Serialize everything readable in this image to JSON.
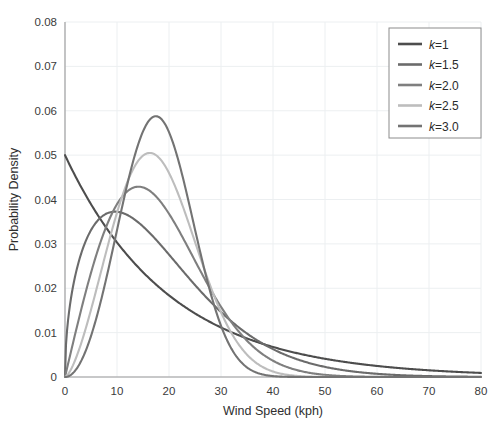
{
  "chart_data": {
    "type": "line",
    "title": "",
    "xlabel": "Wind Speed (kph)",
    "ylabel": "Probability Density",
    "xlim": [
      0,
      80
    ],
    "ylim": [
      0,
      0.08
    ],
    "xticks": [
      0,
      10,
      20,
      30,
      40,
      50,
      60,
      70,
      80
    ],
    "xtick_labels": [
      "0",
      "10",
      "20",
      "30",
      "40",
      "50",
      "60",
      "70",
      "80"
    ],
    "yticks": [
      0,
      0.01,
      0.02,
      0.03,
      0.04,
      0.05,
      0.06,
      0.07,
      0.08
    ],
    "ytick_labels": [
      "0",
      "0.01",
      "0.02",
      "0.03",
      "0.04",
      "0.05",
      "0.06",
      "0.07",
      "0.08"
    ],
    "grid": true,
    "legend_position": "upper right",
    "distribution": "Weibull",
    "scale_lambda": 20,
    "series": [
      {
        "name": "k=1",
        "label_prefix": "k",
        "label_suffix": "=1",
        "shape_k": 1.0,
        "color": "#4d4d4d",
        "peak_x": 0,
        "peak_y": 0.05,
        "x": [
          0,
          2,
          4,
          6,
          8,
          10,
          12,
          14,
          16,
          18,
          20,
          25,
          30,
          35,
          40,
          45,
          50,
          55,
          60,
          65,
          70,
          75,
          80
        ],
        "y": [
          0.05,
          0.04524,
          0.04094,
          0.03704,
          0.03352,
          0.03033,
          0.02744,
          0.02483,
          0.02247,
          0.02033,
          0.01839,
          0.01433,
          0.01116,
          0.00869,
          0.00677,
          0.00527,
          0.0041,
          0.00319,
          0.00249,
          0.00194,
          0.00151,
          0.00118,
          0.00092
        ]
      },
      {
        "name": "k=1.5",
        "label_prefix": "k",
        "label_suffix": "=1.5",
        "shape_k": 1.5,
        "color": "#6b6b6b",
        "peak_x": 9.2,
        "peak_y": 0.03655,
        "x": [
          0,
          2,
          4,
          6,
          8,
          10,
          12,
          14,
          16,
          18,
          20,
          25,
          30,
          35,
          40,
          45,
          50,
          55,
          60,
          65,
          70,
          75,
          80
        ],
        "y": [
          0,
          0.02241,
          0.02994,
          0.03379,
          0.03566,
          0.03632,
          0.03618,
          0.03551,
          0.03447,
          0.03318,
          0.03172,
          0.02762,
          0.02333,
          0.01922,
          0.01548,
          0.01222,
          0.00947,
          0.00722,
          0.0054,
          0.00398,
          0.00288,
          0.00206,
          0.00145
        ]
      },
      {
        "name": "k=2.0",
        "label_prefix": "k",
        "label_suffix": "=2.0",
        "shape_k": 2.0,
        "color": "#7f7f7f",
        "peak_x": 14.1,
        "peak_y": 0.04289,
        "x": [
          0,
          2,
          4,
          6,
          8,
          10,
          12,
          14,
          16,
          18,
          20,
          25,
          30,
          35,
          40,
          45,
          50,
          55,
          60,
          65,
          70,
          75,
          80
        ],
        "y": [
          0,
          0.00995,
          0.01961,
          0.02866,
          0.03679,
          0.04382,
          0.04959,
          0.04289,
          0.04277,
          0.04148,
          0.03679,
          0.0255,
          0.01582,
          0.00876,
          0.00432,
          0.0019,
          0.00075,
          0.00026,
          8e-05,
          2e-05,
          1e-05,
          0.0,
          0.0
        ]
      },
      {
        "name": "k=2.5",
        "label_prefix": "k",
        "label_suffix": "=2.5",
        "shape_k": 2.5,
        "color": "#bdbdbd",
        "peak_x": 15.9,
        "peak_y": 0.05017,
        "x": [
          0,
          2,
          4,
          6,
          8,
          10,
          12,
          14,
          16,
          18,
          20,
          25,
          30,
          35,
          40,
          45,
          50,
          55,
          60,
          65,
          70,
          75,
          80
        ],
        "y": [
          0,
          0.00395,
          0.01105,
          0.01975,
          0.02915,
          0.03817,
          0.04545,
          0.04944,
          0.05017,
          0.04617,
          0.03991,
          0.02104,
          0.00785,
          0.00195,
          0.00031,
          3e-05,
          0.0,
          0.0,
          0.0,
          0.0,
          0.0,
          0.0,
          0.0
        ]
      },
      {
        "name": "k=3.0",
        "label_prefix": "k",
        "label_suffix": "=3.0",
        "shape_k": 3.0,
        "color": "#737373",
        "peak_x": 14.2,
        "peak_y": 0.07406,
        "x": [
          0,
          2,
          4,
          6,
          8,
          10,
          12,
          14,
          16,
          18,
          20,
          25,
          30,
          35,
          40,
          45,
          50,
          55,
          60,
          65,
          70,
          75,
          80
        ],
        "y": [
          0,
          0.0015,
          0.00594,
          0.01319,
          0.02289,
          0.03421,
          0.04576,
          0.05564,
          0.06161,
          0.06161,
          0.05518,
          0.02402,
          0.00483,
          0.00035,
          1e-05,
          0.0,
          0.0,
          0.0,
          0.0,
          0.0,
          0.0,
          0.0,
          0.0
        ]
      }
    ]
  },
  "legend": {
    "entries": [
      {
        "label": "k=1"
      },
      {
        "label": "k=1.5"
      },
      {
        "label": "k=2.0"
      },
      {
        "label": "k=2.5"
      },
      {
        "label": "k=3.0"
      }
    ]
  }
}
